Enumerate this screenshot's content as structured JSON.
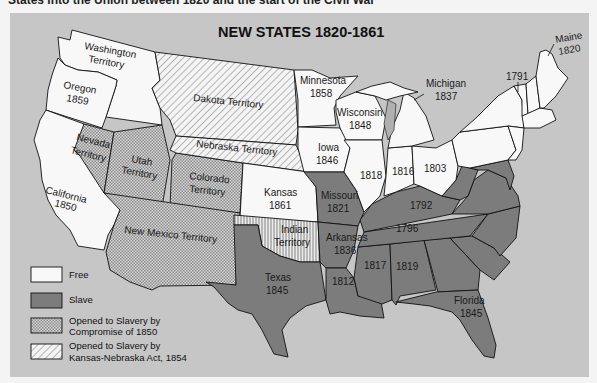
{
  "header_text": "States into the Union between 1820 and the start of the Civil War",
  "map": {
    "title": "NEW STATES  1820-1861",
    "colors": {
      "background": "#c6c6c6",
      "free": "#f8f8f8",
      "slave": "#7c7c7c",
      "compromise_1850": "#cfcfcf",
      "kansas_nebraska": "#f0f0f0",
      "lakes": "#b0b0b0"
    },
    "regions": [
      {
        "name": "Washington",
        "sub": "Territory",
        "status": "free"
      },
      {
        "name": "Oregon",
        "sub": "1859",
        "status": "free"
      },
      {
        "name": "California",
        "sub": "1850",
        "status": "free"
      },
      {
        "name": "Nevada",
        "sub": "Territory",
        "status": "compromise_1850"
      },
      {
        "name": "Utah",
        "sub": "Territory",
        "status": "compromise_1850"
      },
      {
        "name": "Colorado",
        "sub": "Territory",
        "status": "compromise_1850"
      },
      {
        "name": "New Mexico Territory",
        "sub": "",
        "status": "compromise_1850"
      },
      {
        "name": "Dakota Territory",
        "sub": "",
        "status": "kansas_nebraska"
      },
      {
        "name": "Nebraska Territory",
        "sub": "",
        "status": "kansas_nebraska"
      },
      {
        "name": "Kansas",
        "sub": "1861",
        "status": "free"
      },
      {
        "name": "Indian",
        "sub": "Territory",
        "status": "other"
      },
      {
        "name": "Texas",
        "sub": "1845",
        "status": "slave"
      },
      {
        "name": "Minnesota",
        "sub": "1858",
        "status": "free"
      },
      {
        "name": "Wisconsin",
        "sub": "1848",
        "status": "free"
      },
      {
        "name": "Iowa",
        "sub": "1846",
        "status": "free"
      },
      {
        "name": "Missouri",
        "sub": "1821",
        "status": "slave"
      },
      {
        "name": "Arkansas",
        "sub": "1836",
        "status": "slave"
      },
      {
        "name": "Michigan",
        "sub": "1837",
        "status": "free"
      },
      {
        "name": "",
        "sub": "1818",
        "status": "free"
      },
      {
        "name": "",
        "sub": "1816",
        "status": "free"
      },
      {
        "name": "",
        "sub": "1803",
        "status": "free"
      },
      {
        "name": "",
        "sub": "1792",
        "status": "slave"
      },
      {
        "name": "",
        "sub": "1796",
        "status": "slave"
      },
      {
        "name": "",
        "sub": "1812",
        "status": "slave"
      },
      {
        "name": "",
        "sub": "1817",
        "status": "slave"
      },
      {
        "name": "",
        "sub": "1819",
        "status": "slave"
      },
      {
        "name": "Florida",
        "sub": "1845",
        "status": "slave"
      },
      {
        "name": "",
        "sub": "1791",
        "status": "free"
      },
      {
        "name": "Maine",
        "sub": "1820",
        "status": "free"
      }
    ],
    "legend": [
      {
        "key": "free",
        "label1": "Free",
        "label2": ""
      },
      {
        "key": "slave",
        "label1": "Slave",
        "label2": ""
      },
      {
        "key": "compromise_1850",
        "label1": "Opened to Slavery by",
        "label2": "Compromise of 1850"
      },
      {
        "key": "kansas_nebraska",
        "label1": "Opened to Slavery by",
        "label2": "Kansas-Nebraska Act, 1854"
      }
    ]
  }
}
